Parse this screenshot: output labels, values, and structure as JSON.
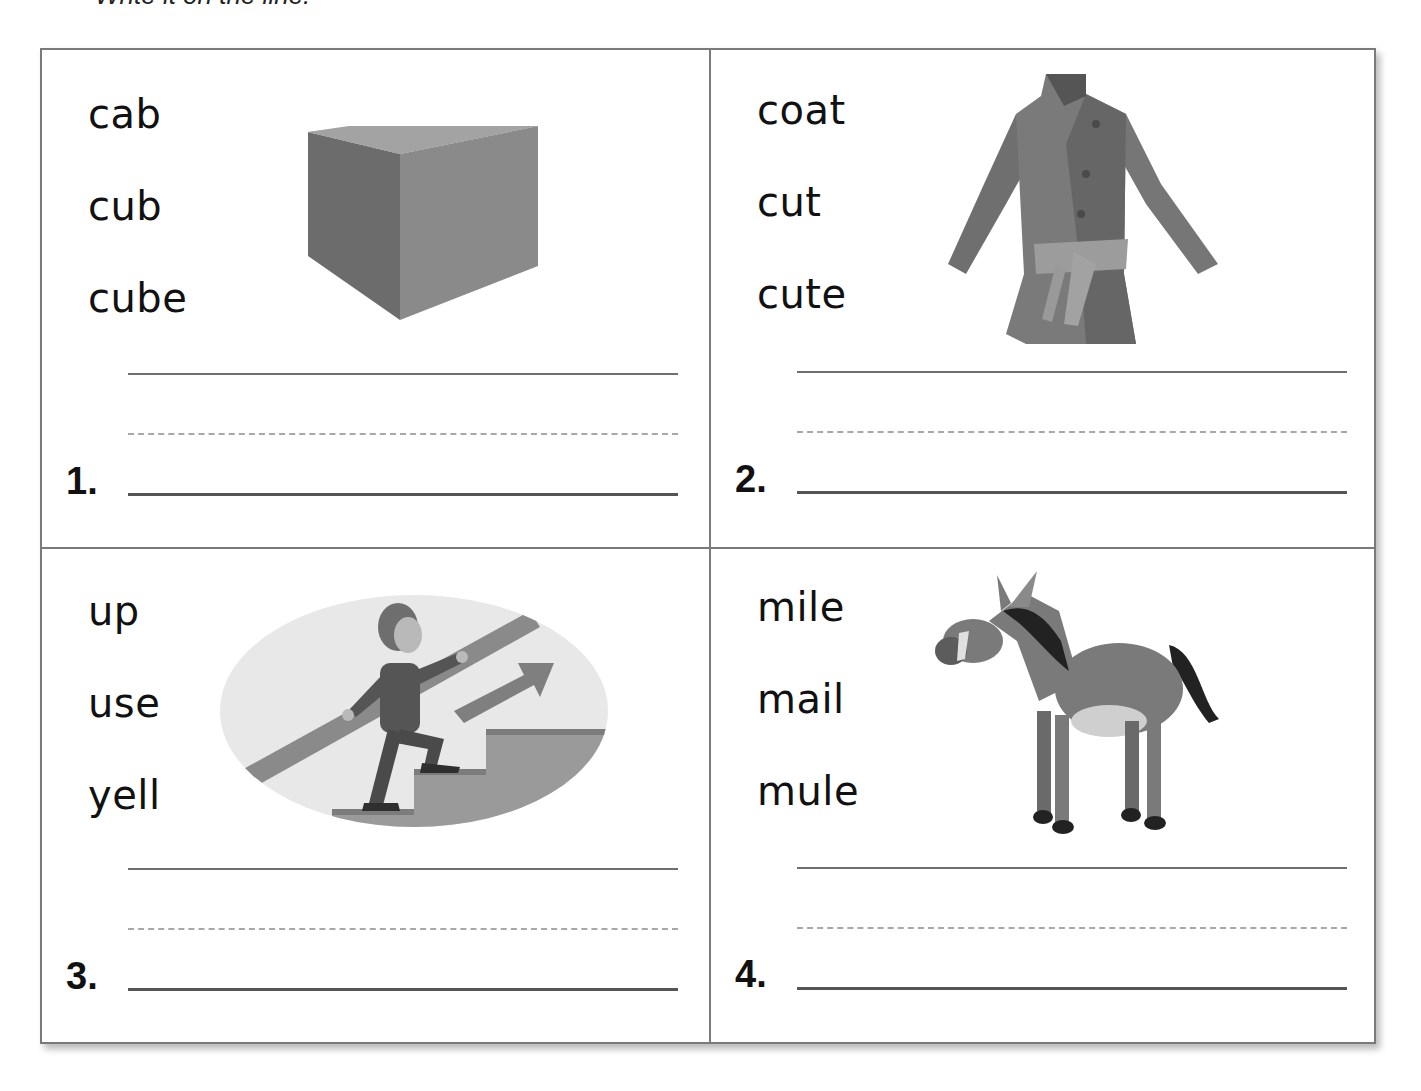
{
  "instruction": "Write it on the line.",
  "cells": [
    {
      "number": "1.",
      "words": [
        "cab",
        "cub",
        "cube"
      ],
      "picture": "cube-picture"
    },
    {
      "number": "2.",
      "words": [
        "coat",
        "cut",
        "cute"
      ],
      "picture": "coat-picture"
    },
    {
      "number": "3.",
      "words": [
        "up",
        "use",
        "yell"
      ],
      "picture": "boy-climbing-stairs-picture"
    },
    {
      "number": "4.",
      "words": [
        "mile",
        "mail",
        "mule"
      ],
      "picture": "mule-picture"
    }
  ],
  "colors": {
    "border": "#7a7a7a",
    "text": "#111111",
    "line_solid": "#6e6e6e",
    "line_dashed": "#a8a8a8",
    "line_base": "#555555"
  }
}
